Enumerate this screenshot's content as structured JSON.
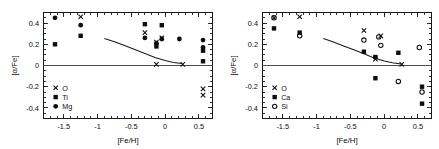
{
  "figure": {
    "background": "#ffffff",
    "foreground": "#0d0d0d",
    "panel_count": 2
  },
  "chart_data": [
    {
      "type": "scatter",
      "panel": "left",
      "title": "",
      "xlabel": "[Fe/H]",
      "ylabel": "[α/Fe]",
      "xlim": [
        -1.8,
        0.7
      ],
      "ylim": [
        -0.5,
        0.5
      ],
      "xticks": [
        -1.5,
        -1,
        -0.5,
        0,
        0.5
      ],
      "xticklabels": [
        "-1.5",
        "-1",
        "-0.5",
        "0",
        "0.5"
      ],
      "yticks": [
        -0.4,
        -0.2,
        0,
        0.2,
        0.4
      ],
      "yticklabels": [
        "-0.4",
        "-0.2",
        "0",
        "0.2",
        "0.4"
      ],
      "grid": false,
      "zero_line": 0,
      "legend_position": "lower-left",
      "series": [
        {
          "name": "O",
          "marker": "cross",
          "points": [
            [
              -1.25,
              0.46
            ],
            [
              -0.3,
              0.31
            ],
            [
              -0.13,
              0.22
            ],
            [
              -0.13,
              0.01
            ],
            [
              -0.05,
              0.26
            ],
            [
              0.26,
              0.01
            ],
            [
              0.56,
              -0.22
            ],
            [
              0.56,
              -0.28
            ]
          ]
        },
        {
          "name": "Ti",
          "marker": "square",
          "points": [
            [
              -1.63,
              0.2
            ],
            [
              -1.25,
              0.28
            ],
            [
              -0.3,
              0.39
            ],
            [
              -0.13,
              0.18
            ],
            [
              -0.05,
              0.38
            ],
            [
              0.56,
              0.14
            ],
            [
              0.56,
              0.04
            ]
          ]
        },
        {
          "name": "Mg",
          "marker": "circle-filled",
          "points": [
            [
              -1.63,
              0.45
            ],
            [
              -1.25,
              0.38
            ],
            [
              -0.3,
              0.26
            ],
            [
              -0.13,
              0.21
            ],
            [
              -0.05,
              0.25
            ],
            [
              0.21,
              0.25
            ],
            [
              0.56,
              0.24
            ],
            [
              0.56,
              0.17
            ]
          ]
        }
      ],
      "model_curve": {
        "name": "chemical-evolution-model",
        "points": [
          [
            -0.9,
            0.255
          ],
          [
            -0.75,
            0.225
          ],
          [
            -0.6,
            0.188
          ],
          [
            -0.45,
            0.15
          ],
          [
            -0.3,
            0.113
          ],
          [
            -0.15,
            0.075
          ],
          [
            0.0,
            0.047
          ],
          [
            0.12,
            0.029
          ],
          [
            0.25,
            0.018
          ]
        ]
      }
    },
    {
      "type": "scatter",
      "panel": "right",
      "title": "",
      "xlabel": "[Fe/H]",
      "ylabel": "[α/Fe]",
      "xlim": [
        -1.8,
        0.7
      ],
      "ylim": [
        -0.5,
        0.5
      ],
      "xticks": [
        -1.5,
        -1,
        -0.5,
        0,
        0.5
      ],
      "xticklabels": [
        "-1.5",
        "-1",
        "-0.5",
        "0",
        "0.5"
      ],
      "yticks": [
        -0.4,
        -0.2,
        0,
        0.2,
        0.4
      ],
      "yticklabels": [
        "-0.4",
        "-0.2",
        "0",
        "0.2",
        "0.4"
      ],
      "grid": false,
      "zero_line": 0,
      "legend_position": "lower-left",
      "series": [
        {
          "name": "O",
          "marker": "cross",
          "points": [
            [
              -1.63,
              0.45
            ],
            [
              -1.25,
              0.46
            ],
            [
              -0.3,
              0.33
            ],
            [
              -0.05,
              0.28
            ],
            [
              -0.13,
              0.06
            ],
            [
              0.26,
              0.01
            ]
          ]
        },
        {
          "name": "Ca",
          "marker": "square",
          "points": [
            [
              -1.63,
              0.35
            ],
            [
              -1.25,
              0.31
            ],
            [
              -0.3,
              0.13
            ],
            [
              -0.13,
              0.08
            ],
            [
              0.21,
              0.12
            ],
            [
              -0.13,
              -0.12
            ],
            [
              0.56,
              -0.2
            ],
            [
              0.56,
              -0.36
            ]
          ]
        },
        {
          "name": "Si",
          "marker": "circle-open",
          "points": [
            [
              -1.63,
              0.45
            ],
            [
              -1.25,
              0.28
            ],
            [
              -0.3,
              0.24
            ],
            [
              -0.08,
              0.27
            ],
            [
              -0.05,
              0.19
            ],
            [
              0.52,
              0.17
            ],
            [
              0.21,
              -0.15
            ],
            [
              0.56,
              -0.25
            ]
          ]
        }
      ],
      "model_curve": {
        "name": "chemical-evolution-model",
        "points": [
          [
            -0.9,
            0.255
          ],
          [
            -0.75,
            0.222
          ],
          [
            -0.6,
            0.185
          ],
          [
            -0.45,
            0.148
          ],
          [
            -0.3,
            0.11
          ],
          [
            -0.15,
            0.07
          ],
          [
            0.0,
            0.042
          ],
          [
            0.12,
            0.025
          ],
          [
            0.25,
            0.014
          ]
        ]
      }
    }
  ],
  "panels": {
    "left": {
      "legend": [
        {
          "label": "O",
          "marker": "cross"
        },
        {
          "label": "Ti",
          "marker": "square"
        },
        {
          "label": "Mg",
          "marker": "circle-filled"
        }
      ]
    },
    "right": {
      "legend": [
        {
          "label": "O",
          "marker": "cross"
        },
        {
          "label": "Ca",
          "marker": "square"
        },
        {
          "label": "Si",
          "marker": "circle-open"
        }
      ]
    }
  }
}
